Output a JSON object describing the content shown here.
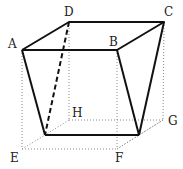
{
  "diagram": {
    "type": "geometry-solid",
    "labels": {
      "A": "A",
      "B": "B",
      "C": "C",
      "D": "D",
      "E": "E",
      "F": "F",
      "G": "G",
      "H": "H"
    },
    "points": {
      "A": [
        22,
        50
      ],
      "B": [
        117,
        50
      ],
      "C": [
        164,
        22
      ],
      "D": [
        69,
        22
      ],
      "E": [
        22,
        149
      ],
      "F": [
        117,
        149
      ],
      "G": [
        163,
        120
      ],
      "H": [
        69,
        120
      ],
      "P": [
        45,
        135
      ],
      "Q": [
        139,
        135
      ]
    },
    "colors": {
      "solid": "#111111",
      "dotted": "#888888",
      "background": "#ffffff"
    }
  }
}
